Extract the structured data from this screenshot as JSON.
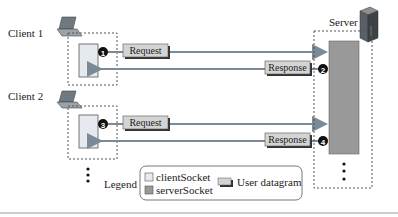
{
  "clients": [
    {
      "label": "Client 1",
      "request_label": "Request",
      "response_label": "Response",
      "request_step": "1",
      "response_step": "2"
    },
    {
      "label": "Client 2",
      "request_label": "Request",
      "response_label": "Response",
      "request_step": "3",
      "response_step": "4"
    }
  ],
  "server": {
    "label": "Server"
  },
  "legend": {
    "title": "Legend",
    "client_socket": "clientSocket",
    "server_socket": "serverSocket",
    "user_datagram": "User datagram"
  },
  "colors": {
    "client_socket": "#e6e9ee",
    "server_socket": "#999999",
    "arrow": "#7a8a96",
    "datagram": "#d4d4d4"
  }
}
